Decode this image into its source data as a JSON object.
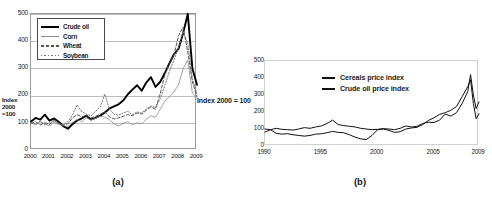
{
  "figure": {
    "caption_a": "(a)",
    "caption_b": "(b)",
    "index_note": "Index 2000 = 100"
  },
  "chart_data": [
    {
      "id": "chart-a",
      "type": "line",
      "title": "",
      "caption": "(a)",
      "xlabel": "",
      "ylabel": "Index 2000 =100",
      "ylabel_lines": [
        "Index",
        "2000",
        "=100"
      ],
      "xlim": [
        2000,
        2009
      ],
      "ylim": [
        0,
        500
      ],
      "yticks": [
        0,
        100,
        200,
        300,
        400,
        500
      ],
      "ytick_labels": [
        "0",
        "100",
        "200",
        "300",
        "400",
        "500"
      ],
      "xticks": [
        2000,
        2001,
        2002,
        2003,
        2004,
        2005,
        2006,
        2007,
        2008,
        2009
      ],
      "xtick_labels": [
        "2000",
        "2001",
        "2002",
        "2003",
        "2004",
        "2005",
        "2006",
        "2007",
        "2008",
        "2009"
      ],
      "grid": true,
      "grid_axis": "y",
      "legend_position": "upper left",
      "legend_entries": [
        "Crude oil",
        "Corn",
        "Wheat",
        "Soybean"
      ],
      "x": [
        2000.0,
        2000.25,
        2000.5,
        2000.75,
        2001.0,
        2001.25,
        2001.5,
        2001.75,
        2002.0,
        2002.25,
        2002.5,
        2002.75,
        2003.0,
        2003.25,
        2003.5,
        2003.75,
        2004.0,
        2004.25,
        2004.5,
        2004.75,
        2005.0,
        2005.25,
        2005.5,
        2005.75,
        2006.0,
        2006.25,
        2006.5,
        2006.75,
        2007.0,
        2007.25,
        2007.5,
        2007.75,
        2008.0,
        2008.25,
        2008.5,
        2008.75,
        2009.0
      ],
      "series": [
        {
          "name": "Crude oil",
          "style": "solid-thick",
          "color": "#000000",
          "values": [
            105,
            118,
            112,
            130,
            108,
            116,
            104,
            88,
            78,
            95,
            108,
            116,
            126,
            112,
            118,
            126,
            138,
            152,
            160,
            168,
            182,
            205,
            222,
            238,
            218,
            248,
            268,
            232,
            250,
            282,
            318,
            352,
            372,
            430,
            500,
            300,
            240
          ]
        },
        {
          "name": "Corn",
          "style": "solid-thin",
          "color": "#8c8c8c",
          "values": [
            100,
            92,
            104,
            96,
            88,
            102,
            94,
            90,
            86,
            102,
            112,
            104,
            118,
            110,
            116,
            124,
            120,
            112,
            96,
            88,
            98,
            104,
            92,
            100,
            96,
            112,
            126,
            120,
            150,
            178,
            196,
            214,
            240,
            300,
            330,
            210,
            190
          ]
        },
        {
          "name": "Wheat",
          "style": "dashed",
          "color": "#555555",
          "values": [
            98,
            104,
            92,
            100,
            94,
            108,
            98,
            92,
            96,
            118,
            130,
            122,
            128,
            118,
            124,
            132,
            140,
            122,
            114,
            118,
            124,
            130,
            126,
            136,
            132,
            146,
            158,
            150,
            206,
            276,
            318,
            350,
            420,
            452,
            360,
            250,
            196
          ]
        },
        {
          "name": "Soybean",
          "style": "dotted",
          "color": "#777777",
          "values": [
            102,
            96,
            106,
            92,
            100,
            110,
            96,
            94,
            104,
            128,
            166,
            140,
            132,
            126,
            142,
            158,
            206,
            150,
            132,
            128,
            136,
            142,
            130,
            140,
            136,
            150,
            162,
            156,
            188,
            236,
            288,
            330,
            378,
            436,
            392,
            262,
            206
          ]
        }
      ]
    },
    {
      "id": "chart-b",
      "type": "line",
      "title": "",
      "caption": "(b)",
      "xlabel": "",
      "ylabel": "",
      "xlim": [
        1990,
        2009
      ],
      "ylim": [
        0,
        500
      ],
      "yticks": [
        0,
        100,
        200,
        300,
        400,
        500
      ],
      "ytick_labels": [
        "0",
        "100",
        "200",
        "300",
        "400",
        "500"
      ],
      "xticks": [
        1990,
        1995,
        2000,
        2005,
        2009
      ],
      "xtick_labels": [
        "1990",
        "1995",
        "2000",
        "2005",
        "2009"
      ],
      "grid": false,
      "legend_position": "upper center",
      "legend_entries": [
        "Cereals price index",
        "Crude oil price index"
      ],
      "x": [
        1990.0,
        1990.5,
        1991.0,
        1991.5,
        1992.0,
        1992.5,
        1993.0,
        1993.5,
        1994.0,
        1994.5,
        1995.0,
        1995.5,
        1996.0,
        1996.5,
        1997.0,
        1997.5,
        1998.0,
        1998.5,
        1999.0,
        1999.5,
        2000.0,
        2000.5,
        2001.0,
        2001.5,
        2002.0,
        2002.5,
        2003.0,
        2003.5,
        2004.0,
        2004.5,
        2005.0,
        2005.5,
        2006.0,
        2006.5,
        2007.0,
        2007.5,
        2008.0,
        2008.25,
        2008.5,
        2008.75,
        2009.0
      ],
      "series": [
        {
          "name": "Cereals price index",
          "style": "solid",
          "color": "#111111",
          "values": [
            100,
            96,
            104,
            98,
            96,
            94,
            100,
            108,
            104,
            112,
            118,
            132,
            152,
            126,
            120,
            116,
            112,
            104,
            100,
            96,
            98,
            102,
            100,
            96,
            104,
            118,
            112,
            116,
            132,
            140,
            138,
            152,
            188,
            176,
            196,
            250,
            320,
            420,
            300,
            220,
            260
          ]
        },
        {
          "name": "Crude oil price index",
          "style": "solid",
          "color": "#111111",
          "values": [
            82,
            96,
            74,
            70,
            72,
            66,
            62,
            58,
            62,
            70,
            72,
            78,
            86,
            80,
            78,
            66,
            52,
            42,
            38,
            62,
            96,
            100,
            92,
            80,
            84,
            100,
            106,
            110,
            126,
            150,
            166,
            186,
            196,
            210,
            232,
            290,
            350,
            390,
            250,
            160,
            190
          ]
        }
      ]
    }
  ]
}
